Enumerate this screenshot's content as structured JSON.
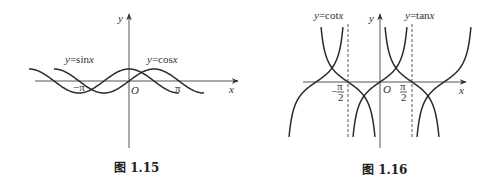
{
  "chart_data": [
    {
      "type": "line",
      "title": "",
      "caption": "图 1.15",
      "xlabel": "x",
      "ylabel": "y",
      "origin_label": "O",
      "x_ticks": [
        {
          "value": -3.14159,
          "label": "−π"
        },
        {
          "value": 3.14159,
          "label": "π"
        }
      ],
      "series": [
        {
          "name": "y=sinx",
          "function": "sin",
          "x_range": [
            -4.712,
            4.712
          ],
          "label": "y=sinx"
        },
        {
          "name": "y=cosx",
          "function": "cos",
          "x_range": [
            -6.283,
            3.14159
          ],
          "label": "y=cosx"
        }
      ],
      "ylim": [
        -1,
        1
      ],
      "grid": false,
      "legend": "inline labels"
    },
    {
      "type": "line",
      "title": "",
      "caption": "图 1.16",
      "xlabel": "x",
      "ylabel": "y",
      "origin_label": "O",
      "x_ticks": [
        {
          "value": -1.5708,
          "label": "−π/2"
        },
        {
          "value": 1.5708,
          "label": "π/2"
        }
      ],
      "asymptotes_dashed": [
        -1.5708,
        1.5708
      ],
      "series": [
        {
          "name": "y=tanx",
          "function": "tan",
          "branches_centered_at": [
            -3.14159,
            0,
            3.14159
          ],
          "label": "y=tanx"
        },
        {
          "name": "y=cotx",
          "function": "cot",
          "branches_centered_at": [
            -1.5708,
            1.5708
          ],
          "label": "y=cotx"
        }
      ],
      "ylim": [
        -4,
        4
      ],
      "grid": false,
      "legend": "inline labels"
    }
  ],
  "fig1": {
    "ylabel": "y",
    "xlabel": "x",
    "origin": "O",
    "sin_label_y": "y",
    "sin_label_rest": "=sin",
    "sin_label_x": "x",
    "cos_label_y": "y",
    "cos_label_rest": "=cos",
    "cos_label_x": "x",
    "neg_pi": "−π",
    "pi": "π",
    "caption": "图 1.15"
  },
  "fig2": {
    "ylabel": "y",
    "xlabel": "x",
    "origin": "O",
    "cot_label_y": "y",
    "cot_label_rest": "=cot",
    "cot_label_x": "x",
    "tan_label_y": "y",
    "tan_label_rest": "=tan",
    "tan_label_x": "x",
    "neg_sign": "−",
    "pi": "π",
    "two": "2",
    "caption": "图 1.16"
  },
  "style": {
    "curve_color": "#2a2a2a",
    "axis_color": "#555555"
  }
}
